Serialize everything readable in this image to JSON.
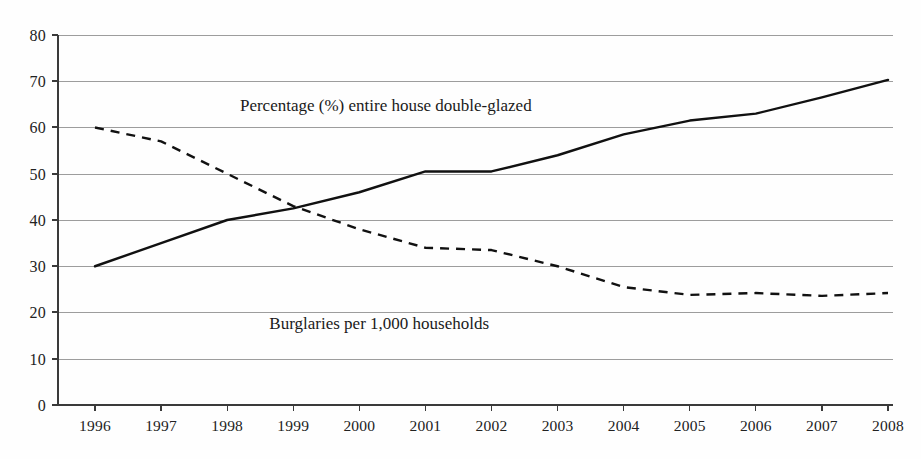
{
  "chart_data": {
    "type": "line",
    "title": "",
    "subtitle": "",
    "xlabel": "",
    "ylabel": "",
    "categories": [
      "1996",
      "1997",
      "1998",
      "1999",
      "2000",
      "2001",
      "2002",
      "2003",
      "2004",
      "2005",
      "2006",
      "2007",
      "2008"
    ],
    "x": [
      1996,
      1997,
      1998,
      1999,
      2000,
      2001,
      2002,
      2003,
      2004,
      2005,
      2006,
      2007,
      2008
    ],
    "ylim": [
      0,
      80
    ],
    "yticks": [
      0,
      10,
      20,
      30,
      40,
      50,
      60,
      70,
      80
    ],
    "ytick_labels": [
      "0",
      "10",
      "20",
      "30",
      "40",
      "50",
      "60",
      "70",
      "80"
    ],
    "grid": "horizontal",
    "legend": "inline-annotations",
    "series": [
      {
        "name": "Percentage (%) entire house double-glazed",
        "style": "solid",
        "color": "#111111",
        "values": [
          30,
          35,
          40,
          42.5,
          46,
          50.5,
          50.5,
          54,
          58.5,
          61.5,
          63,
          66.5,
          70.3
        ]
      },
      {
        "name": "Burglaries per 1,000 households",
        "style": "dashed",
        "color": "#111111",
        "values": [
          60,
          57,
          50,
          43,
          38,
          34,
          33.5,
          30,
          25.5,
          23.8,
          24.2,
          23.6,
          24.2
        ]
      }
    ],
    "annotations": [
      {
        "text": "Percentage (%) entire house double-glazed",
        "x": 2000.4,
        "y": 63.5
      },
      {
        "text": "Burglaries per 1,000 households",
        "x": 2000.3,
        "y": 16.5
      }
    ]
  },
  "axis": {
    "y_tick_0": "0",
    "y_tick_10": "10",
    "y_tick_20": "20",
    "y_tick_30": "30",
    "y_tick_40": "40",
    "y_tick_50": "50",
    "y_tick_60": "60",
    "y_tick_70": "70",
    "y_tick_80": "80"
  },
  "colors": {
    "background": "#fefefe",
    "gridline": "#8d8d8d",
    "axis": "#3a3a3a",
    "series_line": "#111111",
    "text": "#222222"
  }
}
